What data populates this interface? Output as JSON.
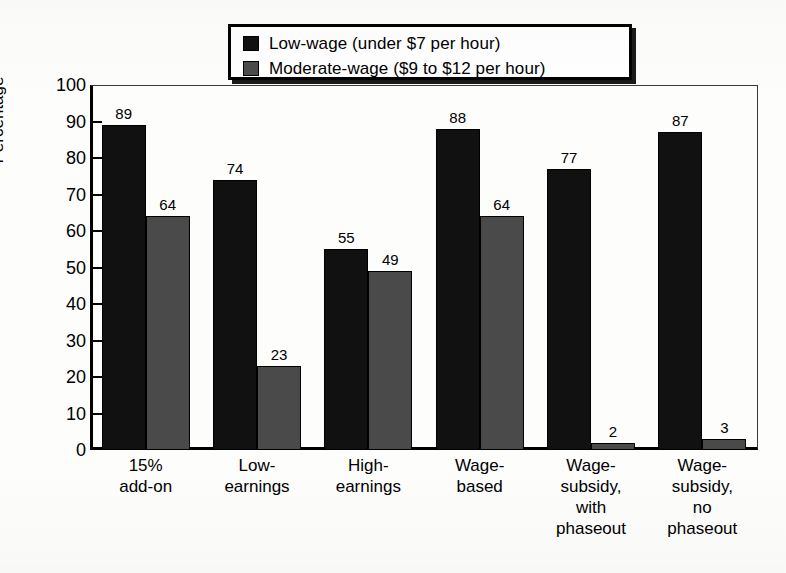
{
  "chart_data": {
    "type": "bar",
    "title": "",
    "xlabel": "",
    "ylabel": "Percentage",
    "ylim": [
      0,
      100
    ],
    "ytick_step": 10,
    "yticks": [
      "100",
      "90",
      "80",
      "70",
      "60",
      "50",
      "40",
      "30",
      "20",
      "10",
      "0"
    ],
    "grid": false,
    "legend_position": "top-center",
    "categories": [
      "15%\nadd-on",
      "Low-\nearnings",
      "High-\nearnings",
      "Wage-\nbased",
      "Wage-\nsubsidy,\nwith\nphaseout",
      "Wage-\nsubsidy,\nno\nphaseout"
    ],
    "category_lines": [
      [
        "15%",
        "add-on"
      ],
      [
        "Low-",
        "earnings"
      ],
      [
        "High-",
        "earnings"
      ],
      [
        "Wage-",
        "based"
      ],
      [
        "Wage-",
        "subsidy,",
        "with",
        "phaseout"
      ],
      [
        "Wage-",
        "subsidy,",
        "no",
        "phaseout"
      ]
    ],
    "series": [
      {
        "name": "Low-wage (under $7 per hour)",
        "key": "low",
        "color": "#111111",
        "values": [
          89,
          74,
          55,
          88,
          77,
          87
        ]
      },
      {
        "name": "Moderate-wage ($9 to $12 per hour)",
        "key": "mod",
        "color": "#4a4a4a",
        "values": [
          64,
          23,
          49,
          64,
          2,
          3
        ]
      }
    ]
  },
  "legend": {
    "items": [
      {
        "label": "Low-wage (under $7 per hour)",
        "color": "#111111"
      },
      {
        "label": "Moderate-wage ($9 to $12 per hour)",
        "color": "#4a4a4a"
      }
    ]
  },
  "axis": {
    "y_title": "Percentage"
  }
}
